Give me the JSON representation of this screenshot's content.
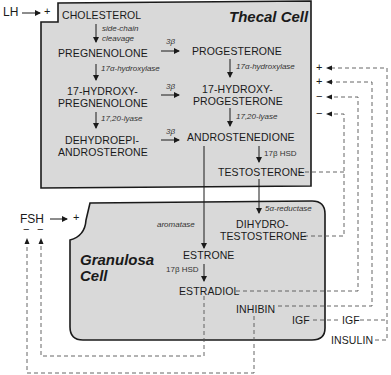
{
  "thecal": {
    "title": "Thecal Cell",
    "cholesterol": "CHOLESTEROL",
    "scc1": "side-chain",
    "scc2": "cleavage",
    "pregnenolone": "PREGNENOLONE",
    "progesterone": "PROGESTERONE",
    "hydroxylase_left": "17α-hydroxylase",
    "hydroxylase_right": "17α-hydroxylase",
    "oh_preg1": "17-HYDROXY-",
    "oh_preg2": "PREGNENOLONE",
    "oh_prog1": "17-HYDROXY-",
    "oh_prog2": "PROGESTERONE",
    "lyase_left": "17,20-lyase",
    "lyase_right": "17,20-lyase",
    "dhea1": "DEHYDROEPI-",
    "dhea2": "ANDROSTERONE",
    "androstenedione": "ANDROSTENEDIONE",
    "hsd": "17β HSD",
    "testosterone": "TESTOSTERONE",
    "beta1": "3β",
    "beta2": "3β",
    "beta3": "3β"
  },
  "granulosa": {
    "title1": "Granulosa",
    "title2": "Cell",
    "aromatase": "aromatase",
    "reductase": "5α-reductase",
    "dht1": "DIHYDRO-",
    "dht2": "TESTOSTERONE",
    "estrone": "ESTRONE",
    "hsd": "17β HSD",
    "estradiol": "ESTRADIOL",
    "inhibin": "INHIBIN",
    "igf_inner": "IGF"
  },
  "external": {
    "lh": "LH",
    "lh_sign": "+",
    "fsh": "FSH",
    "fsh_sign": "+",
    "fsh_neg1": "−",
    "fsh_neg2": "−",
    "igf": "IGF",
    "insulin": "INSULIN",
    "right_signs": [
      "+",
      "+",
      "−",
      "−"
    ]
  },
  "colors": {
    "cell_fill": "#d9d9d9",
    "stroke": "#1a1a1a",
    "dash": "#555555"
  }
}
